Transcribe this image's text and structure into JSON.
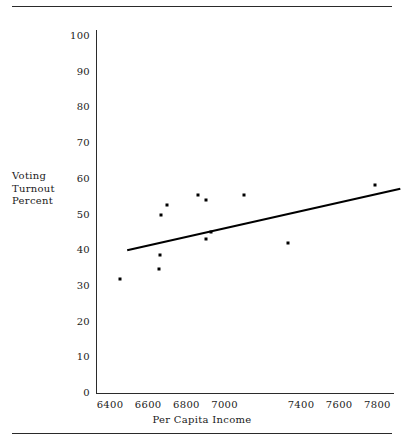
{
  "figure": {
    "has_top_rule": true,
    "has_bottom_rule": true,
    "rule_color": "#2a2a2a",
    "background": "#ffffff"
  },
  "axis_titles": {
    "y_line_1": "Voting",
    "y_line_2": "Turnout",
    "y_line_3": "Percent",
    "x": "Per Capita Income"
  },
  "chart_data": {
    "type": "scatter",
    "title": "",
    "subtitle": "",
    "xlabel": "Per Capita Income",
    "ylabel": "Voting Turnout Percent",
    "xlim": [
      6300,
      7950
    ],
    "ylim": [
      0,
      103
    ],
    "grid": false,
    "legend": "none",
    "x_ticks": [
      6400,
      6600,
      6800,
      7000,
      7400,
      7600,
      7800
    ],
    "x_tick_labels": [
      "6400",
      "6600",
      "6800",
      "7000",
      "7400",
      "7600",
      "7800"
    ],
    "y_ticks": [
      0,
      10,
      20,
      30,
      40,
      50,
      60,
      70,
      80,
      90,
      100
    ],
    "y_tick_labels": [
      "0",
      "10",
      "20",
      "30",
      "40",
      "50",
      "60",
      "70",
      "80",
      "90",
      "100"
    ],
    "marker": "square",
    "marker_color": "#000000",
    "points": [
      {
        "x": 6450,
        "y": 32.0
      },
      {
        "x": 6655,
        "y": 34.7
      },
      {
        "x": 6660,
        "y": 38.7
      },
      {
        "x": 6665,
        "y": 50.0
      },
      {
        "x": 6700,
        "y": 52.7
      },
      {
        "x": 6860,
        "y": 55.5
      },
      {
        "x": 6900,
        "y": 43.2
      },
      {
        "x": 6905,
        "y": 54.0
      },
      {
        "x": 6930,
        "y": 45.2
      },
      {
        "x": 7100,
        "y": 55.5
      },
      {
        "x": 7330,
        "y": 42.0
      },
      {
        "x": 7790,
        "y": 58.2
      }
    ],
    "trendline": {
      "type": "linear-fit",
      "color": "#000000",
      "x_start": 6490,
      "y_start": 40.0,
      "x_end": 7920,
      "y_end": 57.2
    }
  }
}
